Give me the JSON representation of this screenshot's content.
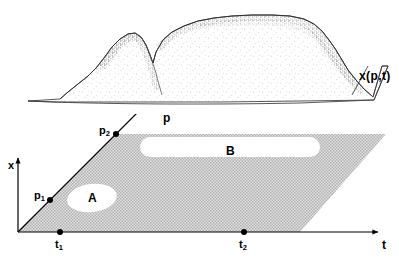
{
  "figure": {
    "type": "scientific-diagram",
    "caption": "",
    "surface": {
      "label": "x(p,t)",
      "description": "stippled relief surface over the (p,t) plane"
    },
    "plane": {
      "fill_color": "#c9c9c9",
      "axes": {
        "x": {
          "label": "x",
          "orientation": "vertical"
        },
        "p": {
          "label": "p",
          "orientation": "diagonal"
        },
        "t": {
          "label": "t",
          "orientation": "horizontal"
        }
      },
      "points": [
        {
          "name": "p1",
          "label": "p",
          "sub": "1"
        },
        {
          "name": "p2",
          "label": "p",
          "sub": "2"
        },
        {
          "name": "t1",
          "label": "t",
          "sub": "1"
        },
        {
          "name": "t2",
          "label": "t",
          "sub": "2"
        }
      ],
      "regions": [
        {
          "name": "A",
          "label": "A",
          "shape": "blob"
        },
        {
          "name": "B",
          "label": "B",
          "shape": "stadium"
        }
      ]
    }
  }
}
